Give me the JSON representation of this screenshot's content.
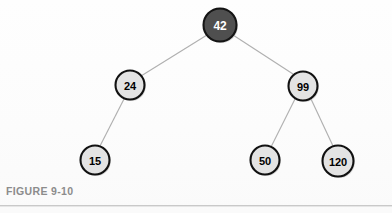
{
  "figure": {
    "caption": "FIGURE 9-10",
    "background_color": "#fdfdfd",
    "rule_color": "#c9c9c9"
  },
  "diagram": {
    "type": "binary-search-tree",
    "root_value": "42",
    "node_fill_root": "#4f4f4f",
    "node_fill_normal": "#e3e3e3",
    "node_stroke": "#111111",
    "edge_color": "#b0b0b0",
    "nodes": [
      {
        "id": "n42",
        "label": "42",
        "cx": 220,
        "cy": 25,
        "r": 16.5,
        "style": "root",
        "font_size": 12
      },
      {
        "id": "n24",
        "label": "24",
        "cx": 130,
        "cy": 85,
        "r": 14.5,
        "style": "normal",
        "font_size": 11
      },
      {
        "id": "n99",
        "label": "99",
        "cx": 303,
        "cy": 86,
        "r": 14.5,
        "style": "normal",
        "font_size": 11
      },
      {
        "id": "n15",
        "label": "15",
        "cx": 95,
        "cy": 160,
        "r": 14.5,
        "style": "normal",
        "font_size": 11
      },
      {
        "id": "n50",
        "label": "50",
        "cx": 265,
        "cy": 160,
        "r": 14.5,
        "style": "normal",
        "font_size": 11
      },
      {
        "id": "n120",
        "label": "120",
        "cx": 338,
        "cy": 161,
        "r": 15.5,
        "style": "normal",
        "font_size": 11
      }
    ],
    "edges": [
      {
        "id": "e42-24",
        "from": "n42",
        "to": "n24",
        "x1": 207,
        "y1": 35,
        "x2": 141,
        "y2": 76
      },
      {
        "id": "e42-99",
        "from": "n42",
        "to": "n99",
        "x1": 233,
        "y1": 35,
        "x2": 293,
        "y2": 74
      },
      {
        "id": "e24-15",
        "from": "n24",
        "to": "n15",
        "x1": 124,
        "y1": 99,
        "x2": 100,
        "y2": 146
      },
      {
        "id": "e99-50",
        "from": "n99",
        "to": "n50",
        "x1": 295,
        "y1": 99,
        "x2": 271,
        "y2": 147
      },
      {
        "id": "e99-120",
        "from": "n99",
        "to": "n120",
        "x1": 311,
        "y1": 99,
        "x2": 333,
        "y2": 146
      }
    ]
  }
}
